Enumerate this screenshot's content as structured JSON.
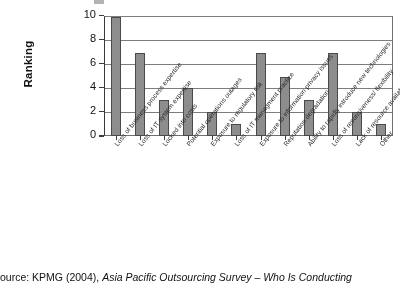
{
  "chart_data": {
    "type": "bar",
    "title": "",
    "xlabel": "",
    "ylabel": "Ranking",
    "ylim": [
      0,
      10
    ],
    "ytick_values": [
      0,
      2,
      4,
      6,
      8,
      10
    ],
    "ytick_labels": [
      "0",
      "2",
      "4",
      "6",
      "8",
      "10"
    ],
    "grid": true,
    "legend": "none",
    "bar_color": "#8d8d8d",
    "bar_edge_color": "#4a4a4a",
    "categories": [
      "Loss of business process expertise",
      "Loss of IT system expertise",
      "Locked into costs",
      "Potential operations outages",
      "Exposure to regulatory risk",
      "Loss of IT managment practice",
      "Exposure to information privacy issues",
      "Reputation degradation",
      "Ability to rapidly introduce new technologies",
      "Loss of resonsiveness/ flexibility",
      "Lack of resource availability",
      "Other"
    ],
    "values": [
      10,
      7,
      3,
      4,
      2,
      1,
      7,
      5,
      3,
      7,
      2,
      1
    ]
  },
  "caption": {
    "prefix": "ource: KPMG (2004), ",
    "italic_title": "Asia Pacific Outsourcing Survey – Who Is Conducting"
  }
}
